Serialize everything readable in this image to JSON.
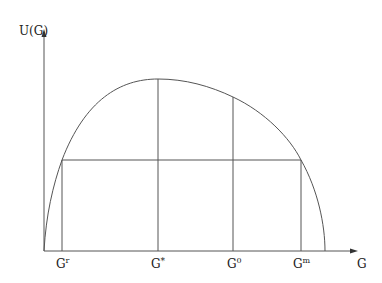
{
  "diagram": {
    "y_axis_label": "U(G)",
    "x_axis_label": "G",
    "tick_labels": [
      {
        "base": "G",
        "sup": "r"
      },
      {
        "base": "G",
        "sup": "*"
      },
      {
        "base": "G",
        "sup": "0"
      },
      {
        "base": "G",
        "sup": "m"
      }
    ],
    "colors": {
      "line": "#555555",
      "text": "#222222",
      "background": "#ffffff"
    }
  }
}
